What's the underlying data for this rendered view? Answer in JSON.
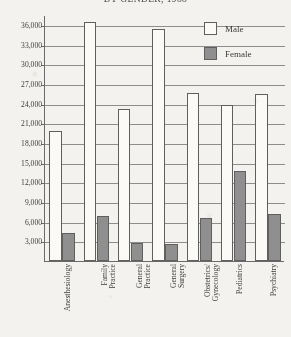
{
  "chart_data": {
    "type": "bar",
    "title": "BY GENDER, 1988",
    "xlabel": "",
    "ylabel": "",
    "ylim": [
      0,
      37500
    ],
    "yticks": [
      3000,
      6000,
      9000,
      12000,
      15000,
      18000,
      21000,
      24000,
      27000,
      30000,
      33000,
      36000
    ],
    "ytick_labels": [
      "3,000",
      "6,000",
      "9,000",
      "12,000",
      "15,000",
      "18,000",
      "21,000",
      "24,000",
      "27,000",
      "30,000",
      "33,000",
      "36,000"
    ],
    "grid": true,
    "legend_position": "top-right",
    "categories": [
      "Anesthesiology",
      "Family Practice",
      "General Practice",
      "General Surgery",
      "Obstetrics/ Gynecology",
      "Pediatrics",
      "Psychiatry"
    ],
    "category_lines": [
      [
        "Anesthesiology"
      ],
      [
        "Family",
        "Practice"
      ],
      [
        "General",
        "Practice"
      ],
      [
        "General",
        "Surgery"
      ],
      [
        "Obstetrics/",
        "Gynecology"
      ],
      [
        "Pediatrics"
      ],
      [
        "Psychiatry"
      ]
    ],
    "series": [
      {
        "name": "Male",
        "color": "#fbfaf7",
        "values": [
          19800,
          36500,
          23200,
          35300,
          25600,
          23800,
          25500
        ]
      },
      {
        "name": "Female",
        "color": "#8f8f8f",
        "values": [
          4300,
          6800,
          2700,
          2600,
          6500,
          13700,
          7200
        ]
      }
    ]
  },
  "legend": {
    "items": [
      {
        "label": "Male",
        "swatch": "male"
      },
      {
        "label": "Female",
        "swatch": "female"
      }
    ]
  }
}
